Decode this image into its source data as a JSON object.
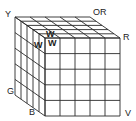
{
  "diagram": {
    "type": "cube-grid",
    "grid_size": 5,
    "line_color": "#2a2a2a",
    "background": "#ffffff",
    "face_labels": {
      "top_left": "Y",
      "top_right": "OR",
      "right": "R",
      "left": "G",
      "bottom": "B",
      "bottom_right": "V"
    },
    "corner_cell_labels": [
      "W",
      "W",
      "W"
    ]
  }
}
